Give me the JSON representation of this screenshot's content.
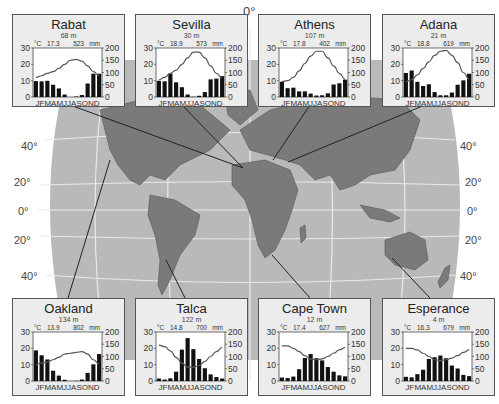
{
  "map": {
    "equator_label": "0°",
    "lat_labels_left": [
      "40°",
      "20°",
      "0°",
      "20°",
      "40°"
    ],
    "lat_labels_right": [
      "40°",
      "20°",
      "0°",
      "20°",
      "40°"
    ],
    "colors": {
      "ocean": "#b9b9b9",
      "land": "#7a7a7a",
      "grid": "#e8e8e8",
      "outside": "#ffffff",
      "box_bg": "#ececec",
      "bars": "#111111",
      "temp_line": "#555555"
    }
  },
  "axis_units": {
    "temp": "°C",
    "precip": "mm"
  },
  "months": "J F M A M J J A S O N D",
  "chart_data": [
    {
      "type": "bar+line",
      "title": "Rabat",
      "elevation": "68 m",
      "mean_temp": "17.3",
      "annual_precip": "523",
      "ylabel_left": "°C",
      "ylabel_right": "mm",
      "ylim_left": [
        0,
        30
      ],
      "ylim_right": [
        0,
        200
      ],
      "left_ticks": [
        0,
        10,
        20,
        30
      ],
      "right_ticks": [
        0,
        50,
        100,
        150,
        200
      ],
      "categories": [
        "J",
        "F",
        "M",
        "A",
        "M",
        "J",
        "J",
        "A",
        "S",
        "O",
        "N",
        "D"
      ],
      "series": [
        {
          "name": "Precipitation (mm)",
          "type": "bar",
          "values": [
            65,
            64,
            66,
            50,
            35,
            10,
            0,
            2,
            8,
            55,
            95,
            95
          ]
        },
        {
          "name": "Temperature (°C)",
          "type": "line",
          "values": [
            12,
            13,
            14.5,
            15.5,
            17.5,
            20,
            22.5,
            23,
            22,
            19,
            15.5,
            13
          ]
        }
      ]
    },
    {
      "type": "bar+line",
      "title": "Sevilla",
      "elevation": "30 m",
      "mean_temp": "18.9",
      "annual_precip": "573",
      "ylabel_left": "°C",
      "ylabel_right": "mm",
      "ylim_left": [
        0,
        30
      ],
      "ylim_right": [
        0,
        200
      ],
      "left_ticks": [
        0,
        10,
        20,
        30
      ],
      "right_ticks": [
        0,
        50,
        100,
        150,
        200
      ],
      "categories": [
        "J",
        "F",
        "M",
        "A",
        "M",
        "J",
        "J",
        "A",
        "S",
        "O",
        "N",
        "D"
      ],
      "series": [
        {
          "name": "Precipitation (mm)",
          "type": "bar",
          "values": [
            66,
            64,
            95,
            60,
            40,
            10,
            1,
            5,
            20,
            72,
            75,
            85
          ]
        },
        {
          "name": "Temperature (°C)",
          "type": "line",
          "values": [
            10.5,
            12,
            14.5,
            16.5,
            20,
            24,
            27.5,
            27.5,
            24,
            19,
            14.5,
            11.5
          ]
        }
      ]
    },
    {
      "type": "bar+line",
      "title": "Athens",
      "elevation": "107 m",
      "mean_temp": "17.8",
      "annual_precip": "402",
      "ylabel_left": "°C",
      "ylabel_right": "mm",
      "ylim_left": [
        0,
        30
      ],
      "ylim_right": [
        0,
        200
      ],
      "left_ticks": [
        0,
        10,
        20,
        30
      ],
      "right_ticks": [
        0,
        50,
        100,
        150,
        200
      ],
      "categories": [
        "J",
        "F",
        "M",
        "A",
        "M",
        "J",
        "J",
        "A",
        "S",
        "O",
        "N",
        "D"
      ],
      "series": [
        {
          "name": "Precipitation (mm)",
          "type": "bar",
          "values": [
            62,
            36,
            38,
            23,
            23,
            14,
            6,
            7,
            15,
            51,
            56,
            71
          ]
        },
        {
          "name": "Temperature (°C)",
          "type": "line",
          "values": [
            9.5,
            10,
            12,
            16,
            20.5,
            25,
            28,
            28,
            24,
            19,
            14.5,
            11
          ]
        }
      ]
    },
    {
      "type": "bar+line",
      "title": "Adana",
      "elevation": "21 m",
      "mean_temp": "18.8",
      "annual_precip": "619",
      "ylabel_left": "°C",
      "ylabel_right": "mm",
      "ylim_left": [
        0,
        30
      ],
      "ylim_right": [
        0,
        200
      ],
      "left_ticks": [
        0,
        10,
        20,
        30
      ],
      "right_ticks": [
        0,
        50,
        100,
        150,
        200
      ],
      "categories": [
        "J",
        "F",
        "M",
        "A",
        "M",
        "J",
        "J",
        "A",
        "S",
        "O",
        "N",
        "D"
      ],
      "series": [
        {
          "name": "Precipitation (mm)",
          "type": "bar",
          "values": [
            98,
            108,
            62,
            45,
            52,
            20,
            7,
            7,
            18,
            50,
            68,
            95
          ]
        },
        {
          "name": "Temperature (°C)",
          "type": "line",
          "values": [
            9.5,
            10.5,
            13.5,
            17.5,
            21.5,
            25.5,
            28,
            28.5,
            25.5,
            21,
            15,
            11
          ]
        }
      ]
    },
    {
      "type": "bar+line",
      "title": "Oakland",
      "elevation": "134 m",
      "mean_temp": "13.9",
      "annual_precip": "802",
      "ylabel_left": "°C",
      "ylabel_right": "mm",
      "ylim_left": [
        0,
        30
      ],
      "ylim_right": [
        0,
        200
      ],
      "left_ticks": [
        0,
        10,
        20,
        30
      ],
      "right_ticks": [
        0,
        50,
        100,
        150,
        200
      ],
      "categories": [
        "J",
        "F",
        "M",
        "A",
        "M",
        "J",
        "J",
        "A",
        "S",
        "O",
        "N",
        "D"
      ],
      "series": [
        {
          "name": "Precipitation (mm)",
          "type": "bar",
          "values": [
            125,
            105,
            88,
            42,
            22,
            5,
            0,
            1,
            6,
            33,
            68,
            110
          ]
        },
        {
          "name": "Temperature (°C)",
          "type": "line",
          "values": [
            10,
            11,
            11.5,
            13,
            14.5,
            16.5,
            17,
            17.5,
            18,
            16.5,
            13,
            10.5
          ]
        }
      ]
    },
    {
      "type": "bar+line",
      "title": "Talca",
      "elevation": "122 m",
      "mean_temp": "14.8",
      "annual_precip": "700",
      "ylabel_left": "°C",
      "ylabel_right": "mm",
      "ylim_left": [
        0,
        30
      ],
      "ylim_right": [
        0,
        200
      ],
      "left_ticks": [
        0,
        10,
        20,
        30
      ],
      "right_ticks": [
        0,
        50,
        100,
        150,
        200
      ],
      "categories": [
        "J",
        "F",
        "M",
        "A",
        "M",
        "J",
        "J",
        "A",
        "S",
        "O",
        "N",
        "D"
      ],
      "series": [
        {
          "name": "Precipitation (mm)",
          "type": "bar",
          "values": [
            10,
            6,
            11,
            38,
            128,
            175,
            130,
            90,
            52,
            27,
            16,
            10
          ]
        },
        {
          "name": "Temperature (°C)",
          "type": "line",
          "values": [
            22,
            21,
            18.5,
            14.5,
            11,
            8.5,
            8.5,
            9.5,
            12,
            15,
            18,
            20.5
          ]
        }
      ]
    },
    {
      "type": "bar+line",
      "title": "Cape Town",
      "elevation": "12 m",
      "mean_temp": "17.4",
      "annual_precip": "627",
      "ylabel_left": "°C",
      "ylabel_right": "mm",
      "ylim_left": [
        0,
        30
      ],
      "ylim_right": [
        0,
        200
      ],
      "left_ticks": [
        0,
        10,
        20,
        30
      ],
      "right_ticks": [
        0,
        50,
        100,
        150,
        200
      ],
      "categories": [
        "J",
        "F",
        "M",
        "A",
        "M",
        "J",
        "J",
        "A",
        "S",
        "O",
        "N",
        "D"
      ],
      "series": [
        {
          "name": "Precipitation (mm)",
          "type": "bar",
          "values": [
            14,
            12,
            18,
            48,
            94,
            110,
            93,
            84,
            57,
            38,
            23,
            19
          ]
        },
        {
          "name": "Temperature (°C)",
          "type": "line",
          "values": [
            21.5,
            21.5,
            20,
            18,
            15.5,
            13.5,
            13,
            13.5,
            15,
            17,
            19,
            20.5
          ]
        }
      ]
    },
    {
      "type": "bar+line",
      "title": "Esperance",
      "elevation": "4 m",
      "mean_temp": "16.3",
      "annual_precip": "679",
      "ylabel_left": "°C",
      "ylabel_right": "mm",
      "ylim_left": [
        0,
        30
      ],
      "ylim_right": [
        0,
        200
      ],
      "left_ticks": [
        0,
        10,
        20,
        30
      ],
      "right_ticks": [
        0,
        50,
        100,
        150,
        200
      ],
      "categories": [
        "J",
        "F",
        "M",
        "A",
        "M",
        "J",
        "J",
        "A",
        "S",
        "O",
        "N",
        "D"
      ],
      "series": [
        {
          "name": "Precipitation (mm)",
          "type": "bar",
          "values": [
            17,
            15,
            28,
            46,
            90,
            97,
            104,
            93,
            63,
            51,
            25,
            20
          ]
        },
        {
          "name": "Temperature (°C)",
          "type": "line",
          "values": [
            20,
            20,
            19,
            17,
            15,
            13,
            12.5,
            13,
            14,
            15.5,
            17.5,
            19
          ]
        }
      ]
    }
  ]
}
